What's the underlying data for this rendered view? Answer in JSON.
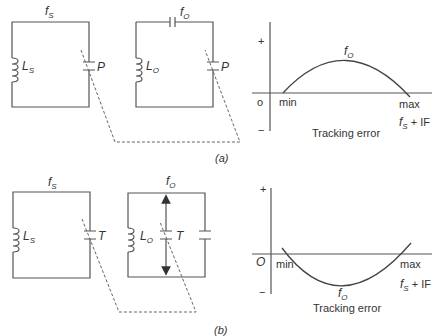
{
  "figure_a": {
    "caption": "(a)",
    "circuit_signal": {
      "freq_label": "f",
      "freq_sub": "S",
      "inductor_label": "L",
      "inductor_sub": "S",
      "capacitor_label": "P"
    },
    "circuit_oscillator": {
      "freq_label": "f",
      "freq_sub": "O",
      "inductor_label": "L",
      "inductor_sub": "O",
      "capacitor_label": "P"
    },
    "graph": {
      "plus_label": "+",
      "minus_label": "−",
      "origin_label": "o",
      "min_label": "min",
      "max_label": "max",
      "curve_label": "f",
      "curve_sub": "O",
      "x_label_f": "f",
      "x_label_sub": "S",
      "x_label_rest": " + IF",
      "title": "Tracking error"
    }
  },
  "figure_b": {
    "caption": "(b)",
    "circuit_signal": {
      "freq_label": "f",
      "freq_sub": "S",
      "inductor_label": "L",
      "inductor_sub": "S",
      "capacitor_label": "T"
    },
    "circuit_oscillator": {
      "freq_label": "f",
      "freq_sub": "O",
      "inductor_label": "L",
      "inductor_sub": "O",
      "capacitor_label": "T"
    },
    "graph": {
      "plus_label": "+",
      "minus_label": "−",
      "origin_label": "O",
      "min_label": "min",
      "max_label": "max",
      "curve_label": "f",
      "curve_sub": "O",
      "x_label_f": "f",
      "x_label_sub": "S",
      "x_label_rest": " + IF",
      "title": "Tracking error"
    }
  },
  "colors": {
    "line": "#555555",
    "text": "#333333"
  }
}
